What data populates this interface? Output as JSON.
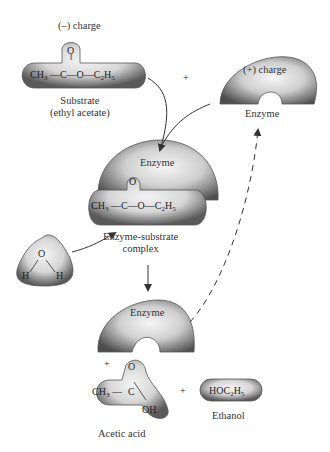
{
  "substrate": {
    "charge_label": "(–) charge",
    "formula_parts": [
      "CH",
      "3",
      " —C—O—C",
      "2",
      "H",
      "5"
    ],
    "carbonyl_o": "O",
    "caption_line1": "Substrate",
    "caption_line2": "(ethyl acetate)"
  },
  "plus_top": "+",
  "enzyme_free": {
    "charge_label": "(+) charge",
    "caption": "Enzyme"
  },
  "complex": {
    "enzyme_label": "Enzyme",
    "carbonyl_o": "O",
    "formula_parts": [
      "CH",
      "3",
      " —C—O—C",
      "2",
      "H",
      "5"
    ],
    "caption_line1": "Enzyme-substrate",
    "caption_line2": "complex"
  },
  "water": {
    "o": "O",
    "h_left": "H",
    "h_right": "H"
  },
  "products": {
    "enzyme_label": "Enzyme",
    "plus_left": "+",
    "acetic_formula_left": "CH",
    "acetic_sub": "3",
    "acetic_c": "C",
    "acetic_o": "O",
    "acetic_oh": "OH",
    "acetic_caption": "Acetic acid",
    "plus_mid": "+",
    "ethanol_formula": [
      "HOC",
      "2",
      "H",
      "5"
    ],
    "ethanol_caption": "Ethanol"
  },
  "colors": {
    "blob_dark": "#555555",
    "blob_light": "#f0f0f0",
    "line": "#333333"
  }
}
